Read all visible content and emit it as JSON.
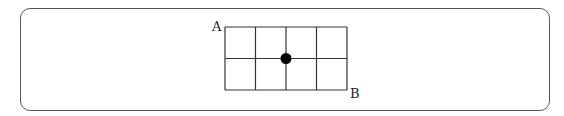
{
  "diagram": {
    "type": "grid-path",
    "grid": {
      "columns": 4,
      "rows": 2,
      "origin": {
        "x": 225,
        "y": 27
      },
      "cell_width": 30.5,
      "cell_height": 31.5,
      "line_color": "#333333"
    },
    "points": {
      "start": {
        "label": "A",
        "position": "top-left corner"
      },
      "end": {
        "label": "B",
        "position": "bottom-right corner"
      }
    },
    "marker": {
      "description": "filled dot at grid intersection",
      "grid_intersection": {
        "col": 2,
        "row": 1
      },
      "color": "#000000"
    }
  }
}
